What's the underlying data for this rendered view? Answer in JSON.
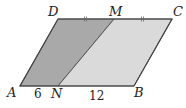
{
  "figure": {
    "colors": {
      "dark_region": "#a9a9a9",
      "light_region": "#d9d9d9",
      "stroke": "#555555"
    },
    "points": {
      "A": {
        "label": "A",
        "x": 20,
        "y": 86
      },
      "N": {
        "label": "N",
        "x": 58,
        "y": 86
      },
      "B": {
        "label": "B",
        "x": 134,
        "y": 86
      },
      "D": {
        "label": "D",
        "x": 58,
        "y": 19
      },
      "M": {
        "label": "M",
        "x": 114,
        "y": 19
      },
      "C": {
        "label": "C",
        "x": 172,
        "y": 19
      }
    },
    "segments": {
      "AN": "6",
      "NB": "12"
    },
    "tick_marks": "DM = MC (double tick marks)"
  }
}
